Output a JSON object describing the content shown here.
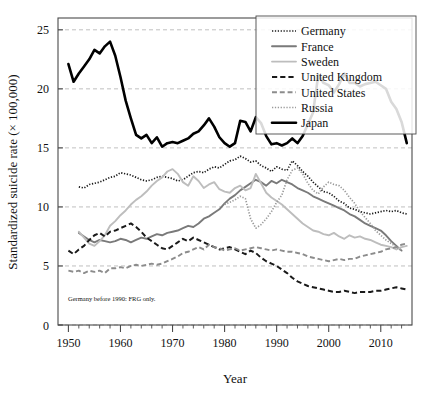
{
  "chart_data": {
    "type": "line",
    "title": "",
    "xlabel": "Year",
    "ylabel": "Standardized suicide rate (× 100,000)",
    "xlim": [
      1948,
      2016
    ],
    "ylim": [
      0,
      26
    ],
    "xticks": [
      1950,
      1960,
      1970,
      1980,
      1990,
      2000,
      2010
    ],
    "xticklabels": [
      "1950",
      "1960",
      "1970",
      "1980",
      "1990",
      "2000",
      "2010"
    ],
    "yticks": [
      0,
      5,
      10,
      15,
      20,
      25
    ],
    "yticklabels": [
      "0",
      "5",
      "10",
      "15",
      "20",
      "25"
    ],
    "minor_xtick_step": 2,
    "grid": true,
    "grid_axis": "y",
    "grid_style": "dashed",
    "legend_position": "top-right",
    "annotation": "Germany before 1990: FRG only.",
    "series": [
      {
        "name": "Germany",
        "color": "#1a1a1a",
        "style": "dotted",
        "width": 1.7,
        "x": [
          1952,
          1953,
          1954,
          1955,
          1956,
          1957,
          1958,
          1959,
          1960,
          1961,
          1962,
          1963,
          1964,
          1965,
          1966,
          1967,
          1968,
          1969,
          1970,
          1971,
          1972,
          1973,
          1974,
          1975,
          1976,
          1977,
          1978,
          1979,
          1980,
          1981,
          1982,
          1983,
          1984,
          1985,
          1986,
          1987,
          1988,
          1989,
          1990,
          1991,
          1992,
          1993,
          1994,
          1995,
          1996,
          1997,
          1998,
          1999,
          2000,
          2001,
          2002,
          2003,
          2004,
          2005,
          2006,
          2007,
          2008,
          2009,
          2010,
          2011,
          2012,
          2013,
          2014,
          2015
        ],
        "y": [
          11.7,
          11.6,
          11.9,
          12.0,
          12.1,
          12.3,
          12.5,
          12.6,
          12.9,
          12.8,
          12.7,
          12.5,
          12.3,
          12.2,
          12.3,
          12.5,
          12.6,
          12.5,
          12.4,
          12.2,
          12.3,
          12.6,
          12.9,
          13.0,
          12.9,
          13.2,
          13.4,
          13.3,
          13.6,
          13.9,
          14.0,
          14.3,
          14.1,
          13.8,
          13.9,
          13.5,
          13.3,
          13.0,
          13.4,
          13.2,
          13.1,
          13.9,
          13.5,
          13.0,
          12.6,
          12.1,
          11.7,
          11.3,
          11.2,
          10.9,
          10.5,
          10.3,
          9.9,
          9.8,
          9.6,
          9.5,
          9.4,
          9.5,
          9.6,
          9.7,
          9.6,
          9.7,
          9.5,
          9.4
        ]
      },
      {
        "name": "France",
        "color": "#7a7a7a",
        "style": "solid",
        "width": 1.9,
        "x": [
          1952,
          1953,
          1954,
          1955,
          1956,
          1957,
          1958,
          1959,
          1960,
          1961,
          1962,
          1963,
          1964,
          1965,
          1966,
          1967,
          1968,
          1969,
          1970,
          1971,
          1972,
          1973,
          1974,
          1975,
          1976,
          1977,
          1978,
          1979,
          1980,
          1981,
          1982,
          1983,
          1984,
          1985,
          1986,
          1987,
          1988,
          1989,
          1990,
          1991,
          1992,
          1993,
          1994,
          1995,
          1996,
          1997,
          1998,
          1999,
          2000,
          2001,
          2002,
          2003,
          2004,
          2005,
          2006,
          2007,
          2008,
          2009,
          2010,
          2011,
          2012,
          2013,
          2014
        ],
        "y": [
          7.8,
          7.5,
          7.2,
          7.0,
          7.2,
          7.1,
          7.0,
          7.1,
          7.3,
          7.2,
          7.0,
          7.2,
          7.4,
          7.3,
          7.5,
          7.7,
          7.6,
          7.8,
          7.9,
          8.0,
          8.2,
          8.4,
          8.3,
          8.6,
          9.0,
          9.2,
          9.5,
          9.8,
          10.3,
          10.7,
          11.0,
          11.4,
          11.7,
          12.0,
          12.3,
          12.1,
          11.8,
          12.2,
          12.0,
          12.3,
          12.1,
          11.9,
          11.6,
          11.4,
          11.2,
          10.9,
          10.7,
          10.5,
          10.3,
          10.1,
          9.9,
          9.7,
          9.4,
          9.2,
          8.9,
          8.6,
          8.4,
          8.2,
          8.0,
          7.6,
          7.1,
          6.7,
          6.3
        ]
      },
      {
        "name": "Sweden",
        "color": "#bdbdbd",
        "style": "solid",
        "width": 1.9,
        "x": [
          1952,
          1953,
          1954,
          1955,
          1956,
          1957,
          1958,
          1959,
          1960,
          1961,
          1962,
          1963,
          1964,
          1965,
          1966,
          1967,
          1968,
          1969,
          1970,
          1971,
          1972,
          1973,
          1974,
          1975,
          1976,
          1977,
          1978,
          1979,
          1980,
          1981,
          1982,
          1983,
          1984,
          1985,
          1986,
          1987,
          1988,
          1989,
          1990,
          1991,
          1992,
          1993,
          1994,
          1995,
          1996,
          1997,
          1998,
          1999,
          2000,
          2001,
          2002,
          2003,
          2004,
          2005,
          2006,
          2007,
          2008,
          2009,
          2010,
          2011,
          2012,
          2013,
          2014,
          2015
        ],
        "y": [
          7.9,
          7.4,
          6.9,
          6.7,
          7.1,
          7.6,
          8.4,
          8.8,
          9.3,
          9.7,
          10.2,
          10.6,
          10.9,
          11.3,
          11.8,
          12.2,
          12.5,
          13.0,
          13.2,
          12.8,
          12.1,
          11.8,
          12.6,
          12.2,
          11.6,
          11.9,
          12.1,
          11.5,
          11.3,
          11.2,
          11.6,
          11.8,
          11.4,
          11.6,
          12.8,
          12.0,
          11.2,
          10.8,
          10.5,
          10.2,
          9.8,
          9.4,
          9.0,
          8.6,
          8.3,
          8.0,
          7.9,
          7.7,
          7.6,
          7.8,
          7.5,
          7.3,
          7.6,
          7.4,
          7.5,
          7.3,
          7.2,
          7.0,
          6.8,
          6.7,
          6.6,
          6.4,
          6.6,
          6.7
        ]
      },
      {
        "name": "United Kingdom",
        "color": "#1a1a1a",
        "style": "dashed",
        "width": 2.0,
        "x": [
          1950,
          1951,
          1952,
          1953,
          1954,
          1955,
          1956,
          1957,
          1958,
          1959,
          1960,
          1961,
          1962,
          1963,
          1964,
          1965,
          1966,
          1967,
          1968,
          1969,
          1970,
          1971,
          1972,
          1973,
          1974,
          1975,
          1976,
          1977,
          1978,
          1979,
          1980,
          1981,
          1982,
          1983,
          1984,
          1985,
          1986,
          1987,
          1988,
          1989,
          1990,
          1991,
          1992,
          1993,
          1994,
          1995,
          1996,
          1997,
          1998,
          1999,
          2000,
          2001,
          2002,
          2003,
          2004,
          2005,
          2006,
          2007,
          2008,
          2009,
          2010,
          2011,
          2012,
          2013,
          2014,
          2015
        ],
        "y": [
          6.3,
          6.0,
          6.4,
          6.7,
          7.2,
          7.6,
          7.8,
          7.5,
          7.9,
          8.0,
          8.2,
          8.4,
          8.6,
          8.3,
          7.9,
          7.4,
          7.1,
          6.8,
          6.5,
          6.4,
          6.7,
          7.0,
          7.3,
          7.1,
          7.4,
          7.2,
          7.0,
          6.8,
          6.6,
          6.4,
          6.5,
          6.6,
          6.4,
          6.2,
          6.0,
          6.3,
          6.1,
          5.7,
          5.4,
          5.2,
          5.0,
          4.7,
          4.4,
          4.0,
          3.7,
          3.5,
          3.3,
          3.2,
          3.1,
          3.0,
          2.9,
          2.8,
          2.8,
          2.9,
          2.8,
          2.7,
          2.8,
          2.8,
          2.8,
          2.9,
          2.9,
          3.0,
          3.1,
          3.2,
          3.1,
          3.0
        ]
      },
      {
        "name": "United States",
        "color": "#8c8c8c",
        "style": "dashed",
        "width": 1.9,
        "x": [
          1950,
          1951,
          1952,
          1953,
          1954,
          1955,
          1956,
          1957,
          1958,
          1959,
          1960,
          1961,
          1962,
          1963,
          1964,
          1965,
          1966,
          1967,
          1968,
          1969,
          1970,
          1971,
          1972,
          1973,
          1974,
          1975,
          1976,
          1977,
          1978,
          1979,
          1980,
          1981,
          1982,
          1983,
          1984,
          1985,
          1986,
          1987,
          1988,
          1989,
          1990,
          1991,
          1992,
          1993,
          1994,
          1995,
          1996,
          1997,
          1998,
          1999,
          2000,
          2001,
          2002,
          2003,
          2004,
          2005,
          2006,
          2007,
          2008,
          2009,
          2010,
          2011,
          2012,
          2013,
          2014,
          2015
        ],
        "y": [
          4.6,
          4.5,
          4.6,
          4.4,
          4.6,
          4.5,
          4.6,
          4.4,
          4.8,
          4.8,
          4.9,
          4.8,
          5.0,
          5.1,
          5.0,
          5.1,
          5.2,
          5.1,
          5.2,
          5.4,
          5.6,
          5.8,
          6.1,
          6.2,
          6.4,
          6.6,
          6.4,
          6.8,
          6.6,
          6.5,
          6.3,
          6.4,
          6.5,
          6.3,
          6.4,
          6.5,
          6.6,
          6.5,
          6.4,
          6.3,
          6.4,
          6.3,
          6.2,
          6.2,
          6.1,
          6.0,
          5.8,
          5.7,
          5.6,
          5.5,
          5.4,
          5.5,
          5.6,
          5.5,
          5.6,
          5.6,
          5.8,
          5.9,
          6.0,
          6.1,
          6.2,
          6.4,
          6.5,
          6.6,
          6.8,
          6.9
        ]
      },
      {
        "name": "Russia",
        "color": "#9a9a9a",
        "style": "dotted",
        "width": 1.7,
        "x": [
          1980,
          1981,
          1982,
          1983,
          1984,
          1985,
          1986,
          1987,
          1988,
          1989,
          1990,
          1991,
          1992,
          1993,
          1994,
          1995,
          1996,
          1997,
          1998,
          1999,
          2000,
          2001,
          2002,
          2003,
          2004,
          2005,
          2006,
          2007,
          2008,
          2009,
          2010,
          2011,
          2012,
          2013,
          2014
        ],
        "y": [
          10.2,
          10.4,
          10.6,
          10.9,
          10.7,
          9.0,
          8.2,
          8.5,
          9.0,
          9.6,
          10.4,
          11.0,
          12.3,
          13.1,
          13.3,
          12.8,
          12.0,
          11.4,
          11.1,
          11.7,
          12.1,
          11.9,
          11.8,
          11.4,
          10.8,
          10.3,
          9.6,
          9.1,
          8.6,
          8.0,
          7.6,
          7.2,
          6.9,
          6.6,
          6.3
        ]
      },
      {
        "name": "Japan",
        "color": "#000000",
        "style": "solid",
        "width": 2.6,
        "x": [
          1950,
          1951,
          1952,
          1953,
          1954,
          1955,
          1956,
          1957,
          1958,
          1959,
          1960,
          1961,
          1962,
          1963,
          1964,
          1965,
          1966,
          1967,
          1968,
          1969,
          1970,
          1971,
          1972,
          1973,
          1974,
          1975,
          1976,
          1977,
          1978,
          1979,
          1980,
          1981,
          1982,
          1983,
          1984,
          1985,
          1986,
          1987,
          1988,
          1989,
          1990,
          1991,
          1992,
          1993,
          1994,
          1995,
          1996,
          1997,
          1998,
          1999,
          2000,
          2001,
          2002,
          2003,
          2004,
          2005,
          2006,
          2007,
          2008,
          2009,
          2010,
          2011,
          2012,
          2013,
          2014,
          2015
        ],
        "y": [
          22.1,
          20.6,
          21.3,
          21.9,
          22.5,
          23.3,
          23.0,
          23.6,
          24.0,
          22.8,
          21.0,
          19.0,
          17.5,
          16.1,
          15.8,
          16.1,
          15.4,
          15.9,
          15.1,
          15.4,
          15.5,
          15.4,
          15.6,
          15.8,
          16.2,
          16.4,
          16.9,
          17.5,
          16.8,
          15.9,
          15.4,
          15.1,
          15.4,
          17.3,
          17.2,
          16.4,
          17.6,
          17.1,
          16.0,
          15.3,
          15.4,
          15.2,
          15.4,
          15.8,
          15.4,
          16.0,
          17.0,
          18.0,
          21.2,
          20.5,
          20.3,
          19.7,
          20.4,
          21.3,
          20.5,
          20.5,
          20.2,
          20.4,
          20.5,
          20.6,
          20.3,
          20.0,
          18.9,
          18.3,
          17.2,
          15.4
        ]
      }
    ]
  },
  "legend": {
    "items": [
      {
        "label": "Germany"
      },
      {
        "label": "France"
      },
      {
        "label": "Sweden"
      },
      {
        "label": "United Kingdom"
      },
      {
        "label": "United States"
      },
      {
        "label": "Russia"
      },
      {
        "label": "Japan"
      }
    ]
  },
  "colors": {
    "germany": "#1a1a1a",
    "france": "#7a7a7a",
    "sweden": "#bdbdbd",
    "united_kingdom": "#1a1a1a",
    "united_states": "#8c8c8c",
    "russia": "#9a9a9a",
    "japan": "#000000",
    "axis": "#4a4a4a",
    "grid": "#b0b0b0",
    "background": "#ffffff"
  }
}
